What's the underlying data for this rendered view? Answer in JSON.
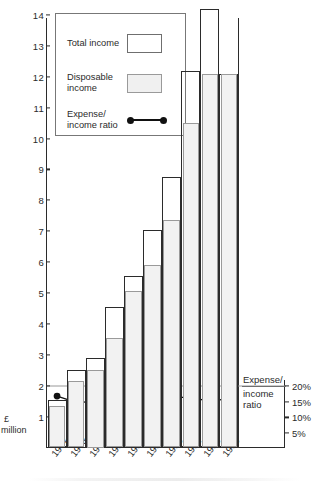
{
  "chart_data": {
    "type": "bar",
    "title": "",
    "xlabel": "",
    "ylabel": "£ million",
    "ylim": [
      0,
      14.6
    ],
    "y2label": "Expense/ income ratio",
    "y2lim": [
      0,
      23
    ],
    "grid": false,
    "legend_position": "top-left",
    "categories": [
      "1977",
      "1978",
      "1979",
      "1980",
      "1981",
      "1982",
      "1983",
      "1984",
      "1985",
      "1986"
    ],
    "series": [
      {
        "name": "Total income",
        "type": "bar",
        "axis": "left",
        "values": [
          1.55,
          2.5,
          2.9,
          4.55,
          5.55,
          7.05,
          8.75,
          12.2,
          14.2,
          12.1
        ]
      },
      {
        "name": "Disposable income",
        "type": "bar",
        "axis": "left",
        "values": [
          1.35,
          2.15,
          2.5,
          3.55,
          5.05,
          5.9,
          7.35,
          10.5,
          12.1,
          12.1
        ]
      },
      {
        "name": "Expense/ income ratio",
        "type": "line",
        "axis": "right",
        "values": [
          16.8,
          14.8,
          15.0,
          15.1,
          15.6,
          14.3,
          16.0,
          16.7,
          14.9,
          16.2
        ]
      }
    ],
    "y_ticks": [
      1,
      2,
      3,
      4,
      5,
      6,
      7,
      8,
      9,
      10,
      11,
      12,
      13,
      14
    ],
    "y_tick_labels": [
      "1",
      "2",
      "3",
      "4",
      "5",
      "6",
      "7",
      "8",
      "9",
      "10",
      "11",
      "12",
      "13",
      "14"
    ],
    "y2_ticks": [
      5,
      10,
      15,
      20
    ],
    "y2_tick_labels": [
      "5%",
      "10%",
      "15%",
      "20%"
    ]
  },
  "axes": {
    "left_unit_line1": "£",
    "left_unit_line2": "million",
    "right_caption_line1": "Expense/",
    "right_caption_line2": "income",
    "right_caption_line3": "ratio"
  },
  "legend": {
    "items": [
      {
        "label_line1": "Total income",
        "label_line2": "",
        "marker": "swatch-white"
      },
      {
        "label_line1": "Disposable",
        "label_line2": "income",
        "marker": "swatch-grey"
      },
      {
        "label_line1": "Expense/",
        "label_line2": "income ratio",
        "marker": "line-dots"
      }
    ]
  },
  "colors": {
    "ink": "#2b2b2b",
    "total_fill": "#ffffff",
    "disposable_fill": "#f2f2f2",
    "disposable_stroke": "#9a9a9a",
    "ratio_line": "#111111",
    "background": "#ffffff"
  }
}
